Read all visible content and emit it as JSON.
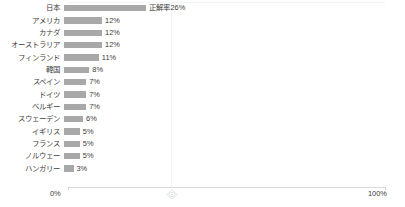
{
  "chart_data": {
    "type": "bar",
    "orientation": "horizontal",
    "title": "",
    "xlabel": "",
    "ylabel": "",
    "xlim": [
      0,
      100
    ],
    "xticks": [
      0,
      100
    ],
    "xtick_labels": [
      "0%",
      "100%"
    ],
    "grid": true,
    "legend": false,
    "unit": "%",
    "categories": [
      "日本",
      "アメリカ",
      "カナダ",
      "オーストラリア",
      "フィンランド",
      "韓国",
      "スペイン",
      "ドイツ",
      "ベルギー",
      "スウェーデン",
      "イギリス",
      "フランス",
      "ノルウェー",
      "ハンガリー"
    ],
    "values": [
      26,
      12,
      12,
      12,
      11,
      8,
      7,
      7,
      7,
      6,
      5,
      5,
      5,
      3
    ],
    "data_labels": [
      "正解率26%",
      "12%",
      "12%",
      "12%",
      "11%",
      "8%",
      "7%",
      "7%",
      "7%",
      "6%",
      "5%",
      "5%",
      "5%",
      "3%"
    ],
    "bar_color": "#a8a8a8",
    "axis_color": "#d9d9d9",
    "text_color": "#3c3c3c"
  },
  "axis": {
    "min_label": "0%",
    "max_label": "100%"
  },
  "marks": {
    "watermark_icon": "diamond-eye-icon"
  }
}
